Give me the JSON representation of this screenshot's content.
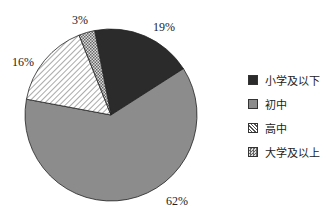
{
  "chart_data": {
    "type": "pie",
    "title": "",
    "categories": [
      "小学及以下",
      "初中",
      "高中",
      "大学及以上"
    ],
    "values": [
      19,
      62,
      16,
      3
    ],
    "labels": [
      "19%",
      "62%",
      "16%",
      "3%"
    ],
    "colors": [
      "#2b2b2b",
      "#8c8c8c",
      "hatch",
      "crosshatch"
    ],
    "legend_position": "right",
    "start_angle_deg": -11,
    "direction": "clockwise"
  },
  "legend": {
    "items": [
      {
        "label": "小学及以下"
      },
      {
        "label": "初中"
      },
      {
        "label": "高中"
      },
      {
        "label": "大学及以上"
      }
    ]
  },
  "slice_labels": {
    "s0": "19%",
    "s1": "62%",
    "s2": "16%",
    "s3": "3%"
  }
}
